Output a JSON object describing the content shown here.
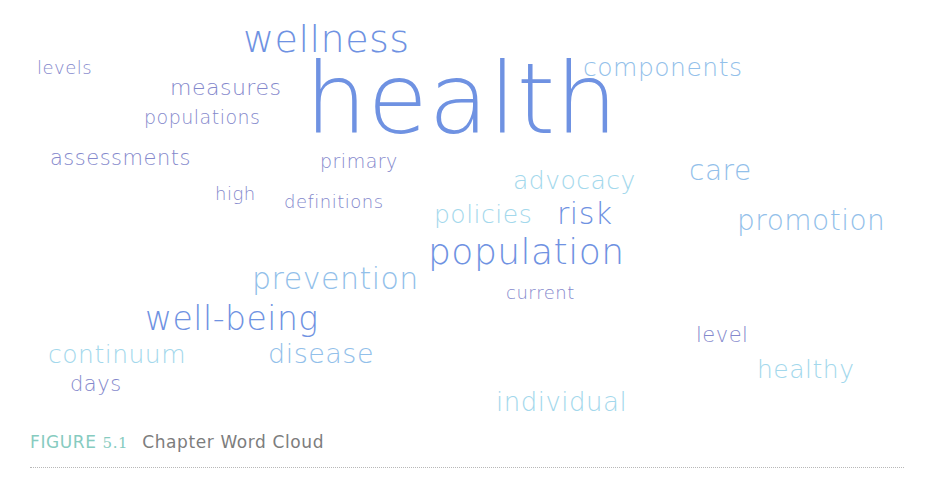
{
  "figure": {
    "label": "FIGURE",
    "number": "5.1",
    "title": "Chapter Word Cloud"
  },
  "colors": {
    "purple": "#8488cc",
    "blue": "#6f92e2",
    "sky": "#92c0ea",
    "cyan": "#a3d8ec",
    "caption_label": "#86cbc0",
    "caption_title": "#7d7d7d",
    "rule": "#b8b8b8"
  },
  "words": [
    {
      "text": "wellness",
      "x": 243,
      "y": 20,
      "size": 38,
      "color": "blue"
    },
    {
      "text": "levels",
      "x": 37,
      "y": 59,
      "size": 18,
      "color": "purple"
    },
    {
      "text": "components",
      "x": 583,
      "y": 55,
      "size": 25,
      "color": "sky"
    },
    {
      "text": "measures",
      "x": 170,
      "y": 77,
      "size": 22,
      "color": "purple"
    },
    {
      "text": "health",
      "x": 305,
      "y": 50,
      "size": 98,
      "color": "blue"
    },
    {
      "text": "populations",
      "x": 144,
      "y": 108,
      "size": 19,
      "color": "purple"
    },
    {
      "text": "assessments",
      "x": 50,
      "y": 148,
      "size": 21,
      "color": "purple"
    },
    {
      "text": "primary",
      "x": 320,
      "y": 152,
      "size": 19,
      "color": "purple"
    },
    {
      "text": "advocacy",
      "x": 513,
      "y": 168,
      "size": 25,
      "color": "cyan"
    },
    {
      "text": "care",
      "x": 689,
      "y": 157,
      "size": 28,
      "color": "sky"
    },
    {
      "text": "high",
      "x": 215,
      "y": 185,
      "size": 18,
      "color": "purple"
    },
    {
      "text": "definitions",
      "x": 284,
      "y": 193,
      "size": 18,
      "color": "purple"
    },
    {
      "text": "policies",
      "x": 434,
      "y": 202,
      "size": 25,
      "color": "cyan"
    },
    {
      "text": "risk",
      "x": 557,
      "y": 199,
      "size": 30,
      "color": "blue"
    },
    {
      "text": "promotion",
      "x": 737,
      "y": 207,
      "size": 28,
      "color": "sky"
    },
    {
      "text": "population",
      "x": 428,
      "y": 234,
      "size": 36,
      "color": "blue"
    },
    {
      "text": "prevention",
      "x": 252,
      "y": 264,
      "size": 30,
      "color": "sky"
    },
    {
      "text": "current",
      "x": 506,
      "y": 284,
      "size": 18,
      "color": "purple"
    },
    {
      "text": "well-being",
      "x": 145,
      "y": 302,
      "size": 33,
      "color": "blue"
    },
    {
      "text": "level",
      "x": 696,
      "y": 325,
      "size": 21,
      "color": "purple"
    },
    {
      "text": "continuum",
      "x": 48,
      "y": 342,
      "size": 25,
      "color": "cyan"
    },
    {
      "text": "disease",
      "x": 268,
      "y": 340,
      "size": 27,
      "color": "sky"
    },
    {
      "text": "healthy",
      "x": 757,
      "y": 357,
      "size": 25,
      "color": "cyan"
    },
    {
      "text": "days",
      "x": 70,
      "y": 374,
      "size": 21,
      "color": "purple"
    },
    {
      "text": "individual",
      "x": 496,
      "y": 389,
      "size": 26,
      "color": "cyan"
    }
  ]
}
